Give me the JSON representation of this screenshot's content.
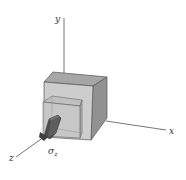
{
  "diagram": {
    "type": "3d-stress-element",
    "axes": {
      "x_label": "x",
      "y_label": "y",
      "z_label": "z"
    },
    "stress_label": {
      "symbol": "σ",
      "subscript": "z"
    },
    "colors": {
      "axis": "#555555",
      "cube_front": "#c9c9c9",
      "cube_top": "#a3a3a3",
      "cube_side": "#8e8e8e",
      "inner_box": "#b8b8b8",
      "arrow_dark": "#4a4a4a",
      "arrow_mid": "#6e6e6e"
    }
  }
}
